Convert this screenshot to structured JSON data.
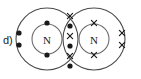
{
  "figure": {
    "label": "d)",
    "type": "lewis-dot-cross-diagram",
    "molecule": "N2",
    "background_color": "#ffffff",
    "line_color": "#4a4a4a",
    "mark_color": "#1a1a1a"
  },
  "atoms": [
    {
      "id": "left-atom",
      "symbol": "N",
      "electron_mark": "dot",
      "center": {
        "x": 47,
        "y": 39
      },
      "inner_radius": 15,
      "outer_radius": 31
    },
    {
      "id": "right-atom",
      "symbol": "N",
      "electron_mark": "cross",
      "center": {
        "x": 94,
        "y": 39
      },
      "inner_radius": 15,
      "outer_radius": 31
    }
  ],
  "electrons": {
    "left_lone_pair": [
      {
        "x": 19,
        "y": 33,
        "mark": "dot"
      },
      {
        "x": 19,
        "y": 45,
        "mark": "dot"
      }
    ],
    "left_shell_marks": [
      {
        "x": 47,
        "y": 23,
        "mark": "dot"
      },
      {
        "x": 47,
        "y": 55,
        "mark": "dot"
      }
    ],
    "right_lone_pair": [
      {
        "x": 122,
        "y": 33,
        "mark": "cross"
      },
      {
        "x": 122,
        "y": 45,
        "mark": "cross"
      }
    ],
    "right_shell_marks": [
      {
        "x": 94,
        "y": 23,
        "mark": "cross"
      },
      {
        "x": 94,
        "y": 55,
        "mark": "cross"
      }
    ],
    "bonding_pairs": [
      {
        "cross": {
          "x": 70,
          "y": 16
        },
        "dot": {
          "x": 70,
          "y": 26
        }
      },
      {
        "cross": {
          "x": 70,
          "y": 36
        },
        "dot": {
          "x": 70,
          "y": 46
        }
      },
      {
        "cross": {
          "x": 70,
          "y": 56
        },
        "dot": {
          "x": 70,
          "y": 66
        }
      }
    ]
  },
  "geometry": {
    "dot_radius": 2.6,
    "cross_arm": 2.6,
    "label_position": {
      "x": 3,
      "y": 40
    }
  }
}
